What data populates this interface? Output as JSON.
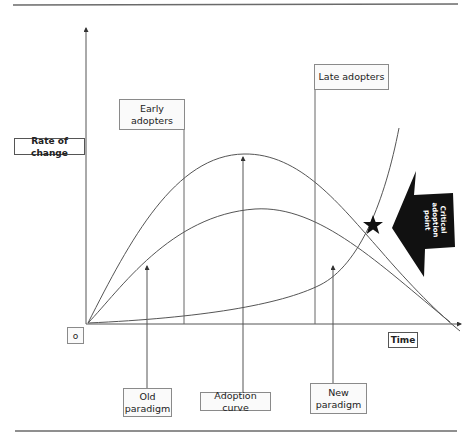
{
  "diagram": {
    "axes": {
      "y_label": "Rate of change",
      "x_label": "Time",
      "origin_label": "o"
    },
    "labels": {
      "early_adopters": "Early\nadopters",
      "late_adopters": "Late adopters",
      "old_paradigm": "Old\nparadigm",
      "adoption_curve": "Adoption curve",
      "new_paradigm": "New\nparadigm"
    },
    "callout": {
      "text": "Critical\nadoption\npoint",
      "marker": "star-icon"
    },
    "curves": [
      {
        "name": "Adoption curve",
        "shape": "bell",
        "peak_position": "middle"
      },
      {
        "name": "Old paradigm",
        "shape": "rise-and-decline",
        "peak_position": "middle"
      },
      {
        "name": "New paradigm",
        "shape": "exponential-growth"
      }
    ],
    "colors": {
      "line": "#555555",
      "callout_fill": "#111111",
      "rule": "#6a6a6a"
    }
  }
}
